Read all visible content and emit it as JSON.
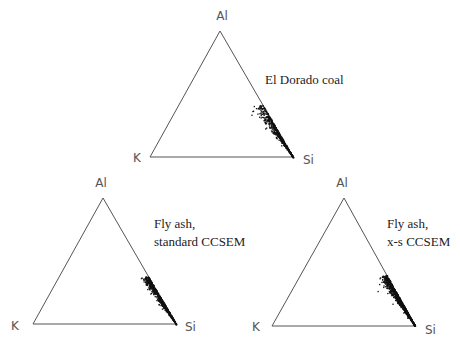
{
  "figure": {
    "colors": {
      "outline": "#555555",
      "points": "#111111",
      "label": "#555555",
      "caption": "#222222"
    },
    "panels": [
      {
        "id": "el-dorado-coal",
        "caption_lines": [
          "El Dorado coal"
        ],
        "caption_pos": [
          265,
          84
        ],
        "vertices": {
          "top": {
            "label": "Al",
            "x": 220,
            "y": 31,
            "label_x": 222,
            "label_y": 20
          },
          "left": {
            "label": "K",
            "x": 150,
            "y": 157,
            "label_x": 133,
            "label_y": 162
          },
          "right": {
            "label": "Si",
            "x": 293,
            "y": 157,
            "label_x": 303,
            "label_y": 164
          }
        },
        "scatter": {
          "t_start": 0.58,
          "t_end": 1.0,
          "spread": 0.13,
          "count": 520,
          "seed": 11,
          "peak": 0.35
        }
      },
      {
        "id": "fly-ash-standard",
        "caption_lines": [
          "Fly ash,",
          "standard CCSEM"
        ],
        "caption_pos": [
          154,
          228
        ],
        "vertices": {
          "top": {
            "label": "Al",
            "x": 103,
            "y": 198,
            "label_x": 101,
            "label_y": 187
          },
          "left": {
            "label": "K",
            "x": 33,
            "y": 324,
            "label_x": 11,
            "label_y": 330
          },
          "right": {
            "label": "Si",
            "x": 176,
            "y": 324,
            "label_x": 185,
            "label_y": 331
          }
        },
        "scatter": {
          "t_start": 0.62,
          "t_end": 1.0,
          "spread": 0.09,
          "count": 700,
          "seed": 23,
          "peak": 0.45
        }
      },
      {
        "id": "fly-ash-xs",
        "caption_lines": [
          "Fly ash,",
          "x-s CCSEM"
        ],
        "caption_pos": [
          387,
          228
        ],
        "vertices": {
          "top": {
            "label": "Al",
            "x": 344,
            "y": 198,
            "label_x": 342,
            "label_y": 187
          },
          "left": {
            "label": "K",
            "x": 272,
            "y": 326,
            "label_x": 252,
            "label_y": 331
          },
          "right": {
            "label": "Si",
            "x": 415,
            "y": 326,
            "label_x": 425,
            "label_y": 334
          }
        },
        "scatter": {
          "t_start": 0.6,
          "t_end": 1.0,
          "spread": 0.1,
          "count": 950,
          "seed": 37,
          "peak": 0.5
        }
      }
    ]
  }
}
